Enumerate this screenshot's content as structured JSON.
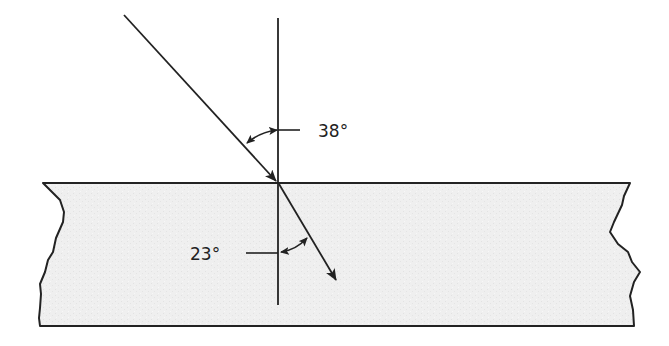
{
  "diagram": {
    "type": "refraction",
    "labels": {
      "incident_angle": "38°",
      "refracted_angle": "23°"
    },
    "colors": {
      "line": "#222222",
      "medium_fill": "#eeeeee",
      "background": "#ffffff"
    }
  }
}
